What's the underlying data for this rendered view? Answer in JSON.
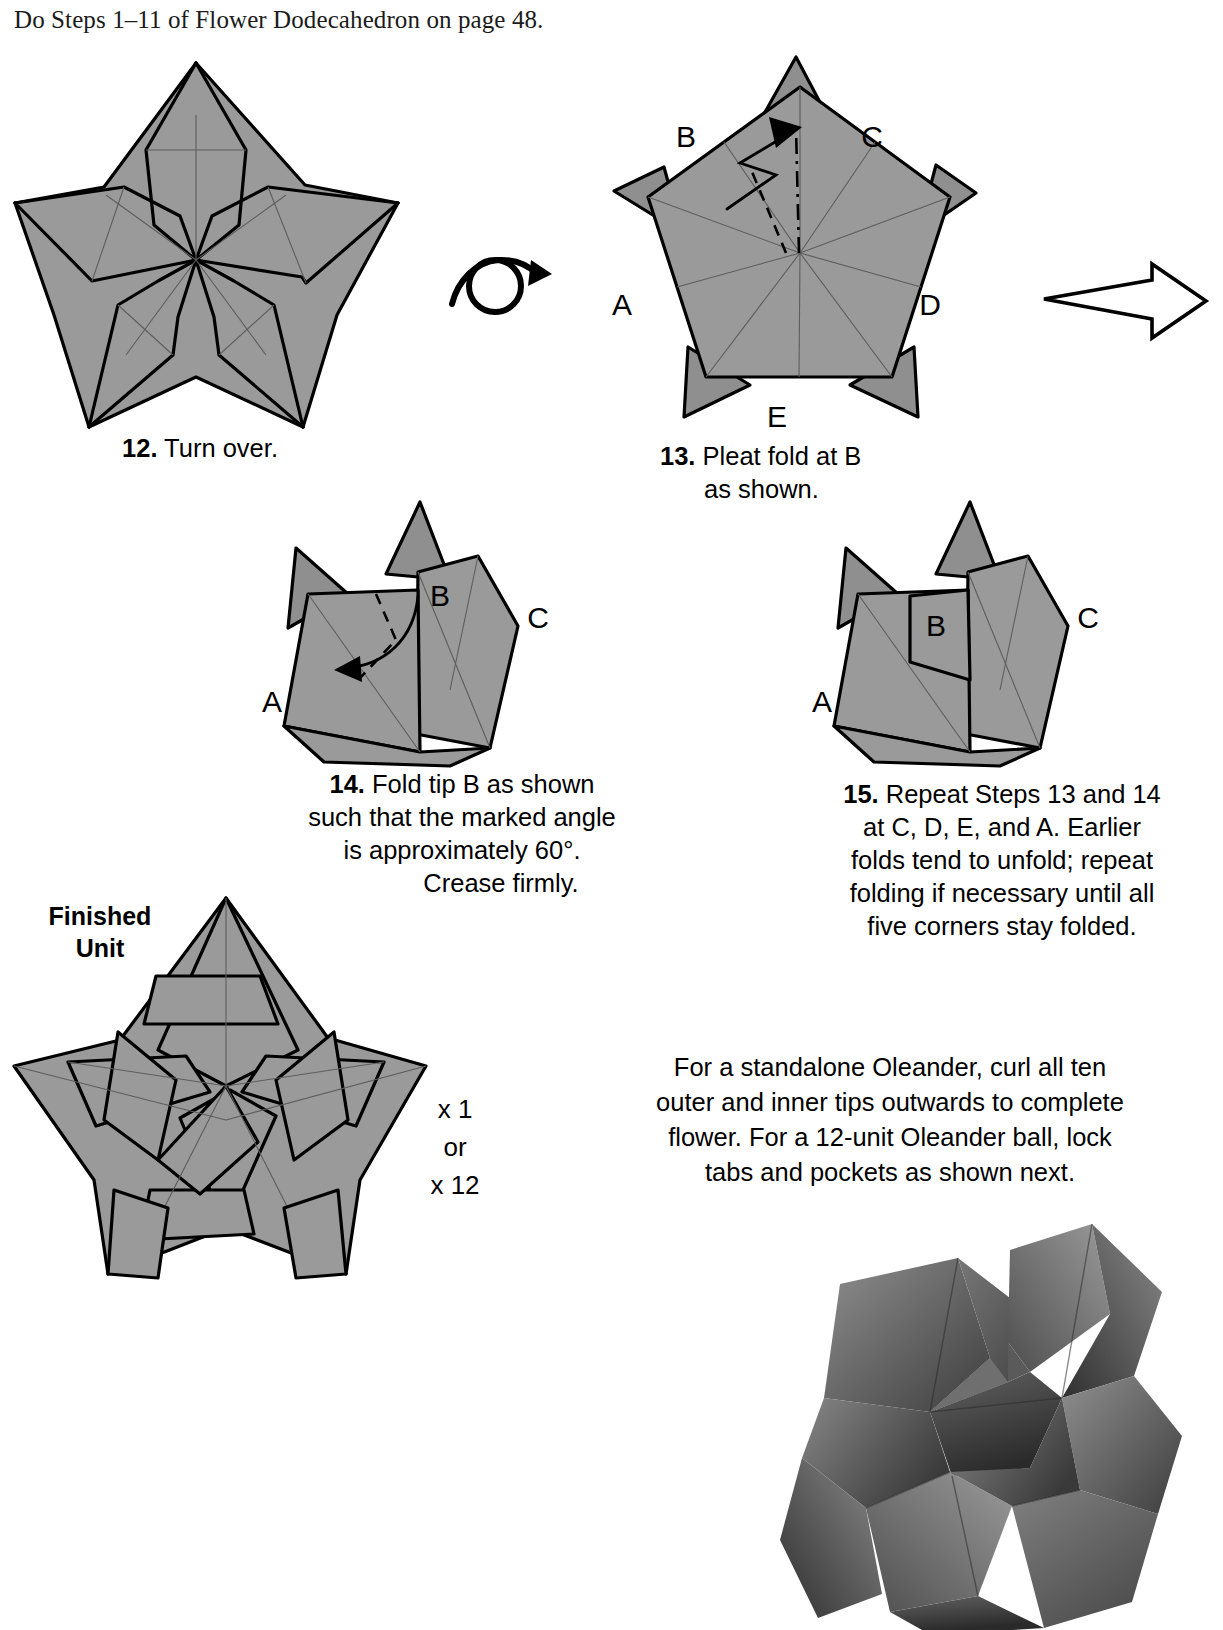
{
  "page": {
    "header_note": "Do Steps 1–11 of Flower Dodecahedron on page 48."
  },
  "steps": [
    {
      "number": "12.",
      "text": "Turn over.",
      "diagram": "five-point-star-creased",
      "labels": []
    },
    {
      "number": "13.",
      "line1": "Pleat fold at B",
      "line2": "as shown.",
      "diagram": "pentagon-with-hidden-points",
      "labels": [
        "A",
        "B",
        "C",
        "D",
        "E"
      ]
    },
    {
      "number": "14.",
      "line1": "Fold tip B as shown",
      "line2": "such that the marked angle",
      "line3": "is approximately  60°.",
      "line4": "Crease firmly.",
      "diagram": "unit-before-tip-fold",
      "labels": [
        "A",
        "B",
        "C"
      ]
    },
    {
      "number": "15.",
      "line1": "Repeat Steps 13 and 14",
      "line2": "at C, D, E, and A.  Earlier",
      "line3": "folds tend to unfold; repeat",
      "line4": "folding if necessary until all",
      "line5": "five corners stay folded.",
      "diagram": "unit-after-tip-fold",
      "labels": [
        "A",
        "B",
        "C"
      ]
    }
  ],
  "finished": {
    "label_line1": "Finished",
    "label_line2": "Unit",
    "quantity_line1": "x 1",
    "quantity_line2": "or",
    "quantity_line3": "x 12"
  },
  "closing_text": {
    "line1": "For a standalone Oleander, curl all ten",
    "line2": "outer and inner tips outwards to complete",
    "line3": "flower.  For a 12-unit Oleander ball, lock",
    "line4": "tabs and pockets as shown next."
  },
  "icons": {
    "turn_over": "turn-over-arrow",
    "proceed": "hollow-right-arrow"
  },
  "colors": {
    "paper_gray": "#9a9a9a",
    "line_black": "#000000",
    "crease_gray": "#5d5d5d",
    "background": "#ffffff"
  }
}
